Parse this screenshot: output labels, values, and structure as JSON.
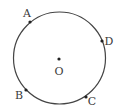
{
  "diagram": {
    "type": "circle-with-points",
    "colors": {
      "stroke": "#444444",
      "point": "#222222",
      "label": "#3a3a3a",
      "background": "#ffffff"
    },
    "circle": {
      "cx": 59.5,
      "cy": 58,
      "r": 46
    },
    "center": {
      "label": "O",
      "x": 59,
      "y": 59,
      "label_x": 59,
      "label_y": 75
    },
    "points": [
      {
        "label": "A",
        "x": 30,
        "y": 22,
        "label_x": 27,
        "label_y": 17
      },
      {
        "label": "D",
        "x": 102,
        "y": 41,
        "label_x": 109,
        "label_y": 45
      },
      {
        "label": "B",
        "x": 26,
        "y": 90,
        "label_x": 19,
        "label_y": 99
      },
      {
        "label": "C",
        "x": 86,
        "y": 97,
        "label_x": 92,
        "label_y": 105
      }
    ]
  }
}
